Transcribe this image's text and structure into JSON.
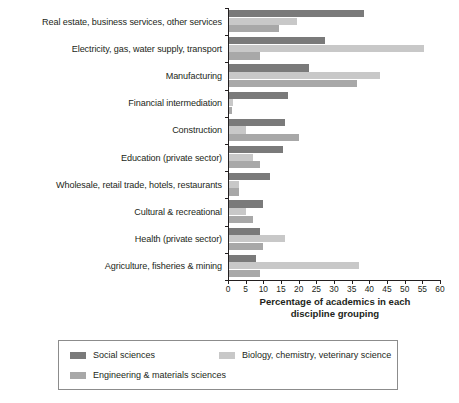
{
  "chart_data": {
    "type": "bar",
    "orientation": "horizontal",
    "title": "",
    "xlabel": "Percentage of academics in each discipline grouping",
    "ylabel": "",
    "xlim": [
      0,
      60
    ],
    "xticks": [
      0,
      5,
      10,
      15,
      20,
      25,
      30,
      35,
      40,
      45,
      50,
      55,
      60
    ],
    "grid": false,
    "legend_position": "bottom",
    "categories": [
      "Real estate, business services, other services",
      "Electricity, gas, water supply, transport",
      "Manufacturing",
      "Financial intermediation",
      "Construction",
      "Education (private sector)",
      "Wholesale, retail trade, hotels, restaurants",
      "Cultural & recreational",
      "Health (private sector)",
      "Agriculture, fisheries & mining"
    ],
    "series": [
      {
        "name": "Social sciences",
        "color": "#7a7a7a",
        "values": [
          38.5,
          27.5,
          23.0,
          17.0,
          16.0,
          15.5,
          12.0,
          10.0,
          9.0,
          8.0
        ]
      },
      {
        "name": "Biology, chemistry, veterinary science",
        "color": "#c8c8c8",
        "values": [
          19.5,
          55.5,
          43.0,
          1.5,
          5.0,
          7.0,
          3.0,
          5.0,
          16.0,
          37.0
        ]
      },
      {
        "name": "Engineering & materials sciences",
        "color": "#a8a8a8",
        "values": [
          14.5,
          9.0,
          36.5,
          1.0,
          20.0,
          9.0,
          3.0,
          7.0,
          10.0,
          9.0
        ]
      }
    ]
  },
  "axis": {
    "title_line1": "Percentage of academics in each",
    "title_line2": "discipline grouping",
    "tick_labels": [
      "0",
      "5",
      "10",
      "15",
      "20",
      "25",
      "30",
      "35",
      "40",
      "45",
      "50",
      "55",
      "60"
    ]
  },
  "legend": {
    "entries": [
      {
        "label": "Social sciences",
        "color": "#7a7a7a"
      },
      {
        "label": "Biology, chemistry, veterinary science",
        "color": "#c8c8c8"
      },
      {
        "label": "Engineering & materials sciences",
        "color": "#a8a8a8"
      }
    ]
  }
}
